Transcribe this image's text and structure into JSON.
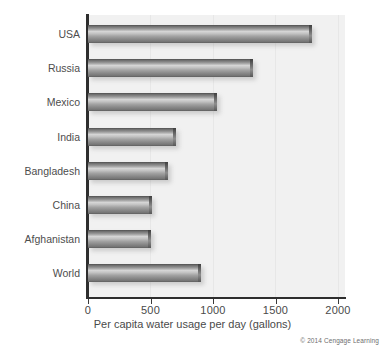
{
  "chart_data": {
    "type": "bar",
    "orientation": "horizontal",
    "title": "",
    "subtitle": "",
    "xlabel": "Per capita water usage per day (gallons)",
    "ylabel": "",
    "categories": [
      "USA",
      "Russia",
      "Mexico",
      "India",
      "Bangladesh",
      "China",
      "Afghanistan",
      "World"
    ],
    "values": [
      1790,
      1320,
      1030,
      705,
      640,
      515,
      500,
      900
    ],
    "series": [
      {
        "name": "Per capita water usage per day (gallons)",
        "values": [
          1790,
          1320,
          1030,
          705,
          640,
          515,
          500,
          900
        ]
      }
    ],
    "xlim": [
      0,
      2000
    ],
    "xticks": [
      0,
      500,
      1000,
      1500,
      2000
    ],
    "xtick_labels": [
      "0",
      "500",
      "1000",
      "1500",
      "2000"
    ],
    "grid": true,
    "grid_axis": "x",
    "legend": false,
    "legend_position": "none",
    "bar_color": "#8f8f8f",
    "plot_background": "#f1f1f1",
    "axis_color": "#2e2e2e"
  },
  "credit": {
    "text": "© 2014 Cengage Learning"
  }
}
